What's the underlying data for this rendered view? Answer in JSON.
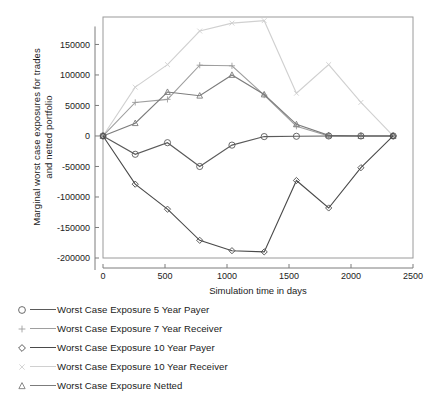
{
  "chart_data": {
    "type": "line",
    "title": "",
    "xlabel": "Simulation time in days",
    "ylabel": "Marginal worst case exposures for trades\nand netted portfolio",
    "xlim": [
      0,
      2500
    ],
    "ylim": [
      -200000,
      195000
    ],
    "grid": false,
    "legend_position": "below-plot",
    "xticks": [
      0,
      500,
      1000,
      1500,
      2000,
      2500
    ],
    "xtick_labels": [
      "0",
      "500",
      "1000",
      "1500",
      "2000",
      "2500"
    ],
    "yticks": [
      150000,
      100000,
      50000,
      0,
      -50000,
      -100000,
      -150000,
      -200000
    ],
    "ytick_labels": [
      "150000",
      "100000",
      "50000",
      "0",
      "-50000",
      "-100000",
      "-150000",
      "-200000"
    ],
    "x": [
      0,
      260,
      520,
      780,
      1040,
      1300,
      1560,
      1820,
      2080,
      2340
    ],
    "series": [
      {
        "name": "Worst Case Exposure 5 Year Payer",
        "marker": "circle",
        "color": "#5a5a5a",
        "values": [
          0,
          -30000,
          -11000,
          -50000,
          -15000,
          -1000,
          -500,
          0,
          0,
          0
        ]
      },
      {
        "name": "Worst Case Exposure 7 Year Receiver",
        "marker": "plus",
        "color": "#9e9e9e",
        "values": [
          0,
          55000,
          60000,
          116000,
          115000,
          67000,
          16000,
          0,
          0,
          0
        ]
      },
      {
        "name": "Worst Case Exposure 10 Year Payer",
        "marker": "diamond",
        "color": "#4a4a4a",
        "values": [
          0,
          -79000,
          -120000,
          -171000,
          -188000,
          -190000,
          -73000,
          -118000,
          -52000,
          0
        ]
      },
      {
        "name": "Worst Case Exposure 10 Year Receiver",
        "marker": "cross",
        "color": "#d0d0d0",
        "values": [
          0,
          80000,
          117000,
          172000,
          185000,
          189000,
          70000,
          117000,
          55000,
          0
        ]
      },
      {
        "name": "Worst Case Exposure Netted",
        "marker": "triangle",
        "color": "#7c7c7c",
        "values": [
          0,
          21000,
          72000,
          66000,
          100000,
          68000,
          19000,
          1000,
          0,
          0
        ]
      }
    ]
  },
  "legend": {
    "items": [
      {
        "label": "Worst Case Exposure 5 Year Payer"
      },
      {
        "label": "Worst Case Exposure 7 Year Receiver"
      },
      {
        "label": "Worst Case Exposure 10 Year Payer"
      },
      {
        "label": "Worst Case Exposure 10 Year Receiver"
      },
      {
        "label": "Worst Case Exposure Netted"
      }
    ]
  }
}
